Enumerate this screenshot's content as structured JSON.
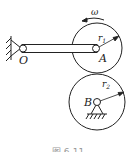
{
  "diagram": {
    "labels": {
      "pivot": "O",
      "gear_a_center": "A",
      "gear_b_center": "B",
      "radius_a": "r",
      "radius_a_sub": "1",
      "radius_b": "r",
      "radius_b_sub": "2",
      "angular_velocity": "ω"
    },
    "caption": "图 6-11",
    "colors": {
      "stroke": "#222222",
      "background": "#ffffff"
    }
  }
}
